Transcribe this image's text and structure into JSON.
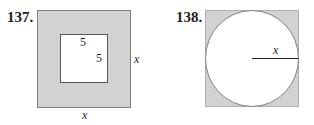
{
  "problems": [
    {
      "number": "137.",
      "figure": "square-with-inner-square",
      "labels": {
        "inner_top": "5",
        "inner_right": "5",
        "outer_right": "x",
        "outer_bottom": "x"
      },
      "colors": {
        "shade": "#d2d2d2",
        "stroke": "#808080"
      }
    },
    {
      "number": "138.",
      "figure": "square-with-inscribed-circle",
      "labels": {
        "radius": "x"
      },
      "colors": {
        "shade": "#d2d2d2",
        "stroke": "#808080",
        "radius_line": "#231f20"
      }
    }
  ]
}
